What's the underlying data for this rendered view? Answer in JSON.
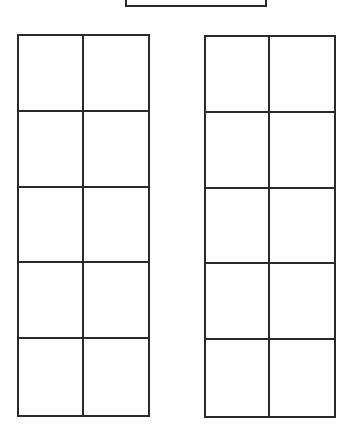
{
  "colors": {
    "line": "#2a2a2a",
    "background": "#ffffff"
  },
  "top_box": {
    "x": 125,
    "y": -4,
    "width": 142,
    "height": 11
  },
  "grids": [
    {
      "name": "left-grid",
      "x": 17,
      "y": 34,
      "width": 133,
      "height": 383,
      "rows": 5,
      "cols": 2
    },
    {
      "name": "right-grid",
      "x": 204,
      "y": 35,
      "width": 132,
      "height": 383,
      "rows": 5,
      "cols": 2
    }
  ]
}
